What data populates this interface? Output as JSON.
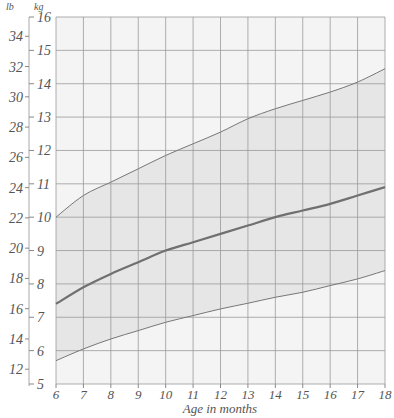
{
  "chart_data": {
    "type": "line",
    "title": "",
    "xlabel": "Age in months",
    "ylabel_left": "lb",
    "ylabel_right": "kg",
    "x": [
      6,
      7,
      8,
      9,
      10,
      11,
      12,
      13,
      14,
      15,
      16,
      17,
      18
    ],
    "xlim": [
      6,
      18
    ],
    "ylim_kg": [
      5,
      16
    ],
    "x_ticks": [
      "6",
      "7",
      "8",
      "9",
      "10",
      "11",
      "12",
      "13",
      "14",
      "15",
      "16",
      "17",
      "18"
    ],
    "kg_ticks": [
      "5",
      "6",
      "7",
      "8",
      "9",
      "10",
      "11",
      "12",
      "13",
      "14",
      "15",
      "16"
    ],
    "lb_ticks": [
      "12",
      "14",
      "16",
      "18",
      "20",
      "22",
      "24",
      "26",
      "28",
      "30",
      "32",
      "34"
    ],
    "grid": true,
    "series": [
      {
        "name": "upper",
        "values": [
          10.0,
          10.65,
          11.05,
          11.45,
          11.85,
          12.2,
          12.55,
          12.95,
          13.25,
          13.5,
          13.75,
          14.05,
          14.45
        ]
      },
      {
        "name": "median",
        "values": [
          7.4,
          7.9,
          8.3,
          8.65,
          9.0,
          9.25,
          9.5,
          9.75,
          10.0,
          10.2,
          10.4,
          10.65,
          10.9
        ]
      },
      {
        "name": "lower",
        "values": [
          5.7,
          6.05,
          6.35,
          6.6,
          6.85,
          7.05,
          7.25,
          7.42,
          7.6,
          7.75,
          7.95,
          8.15,
          8.4
        ]
      }
    ],
    "band": {
      "between": [
        "upper",
        "lower"
      ],
      "color": "#e6e6e6"
    },
    "colors": {
      "median": "#707070",
      "bounds": "#777777",
      "grid": "#9a9a9a",
      "background": "#f4f4f4"
    }
  }
}
